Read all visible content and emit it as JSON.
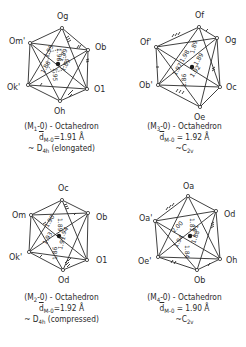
{
  "panels": [
    {
      "id": "M1",
      "title_prefix": "(M",
      "title_sub": "1",
      "title_suffix": "-0) - Octahedron",
      "d_prefix": "d",
      "d_sub": "M-0",
      "d_value": "=1.91 Å",
      "symmetry_prefix": "~ D",
      "symmetry_sub": "4h",
      "symmetry_suffix": " (elongated)",
      "vertices": [
        {
          "label": "Og",
          "sub": "g",
          "x": 62,
          "y": 28
        },
        {
          "label": "Om'",
          "sub": "m'",
          "x": 30,
          "y": 43
        },
        {
          "label": "Ob",
          "sub": "b",
          "x": 88,
          "y": 50
        },
        {
          "label": "Ok'",
          "sub": "k'",
          "x": 28,
          "y": 85
        },
        {
          "label": "O1",
          "sub": "1",
          "x": 87,
          "y": 89
        },
        {
          "label": "Oh",
          "sub": "h",
          "x": 60,
          "y": 101
        }
      ],
      "distances": [
        "1.98",
        "1.89",
        "1.89",
        "1.95",
        "1.95",
        "1.86"
      ]
    },
    {
      "id": "M3",
      "title_prefix": "(M",
      "title_sub": "3",
      "title_suffix": "-0) - Octahedron",
      "d_prefix": "d",
      "d_sub": "M-0",
      "d_value": " = 1.92 Å",
      "symmetry_prefix": "~C",
      "symmetry_sub": "2v",
      "symmetry_suffix": "",
      "vertices": [
        {
          "label": "Of",
          "sub": "f",
          "x": 199,
          "y": 27
        },
        {
          "label": "Of'",
          "sub": "f'",
          "x": 156,
          "y": 47
        },
        {
          "label": "Og",
          "sub": "g",
          "x": 217,
          "y": 38
        },
        {
          "label": "Ob'",
          "sub": "b'",
          "x": 158,
          "y": 85
        },
        {
          "label": "Oc",
          "sub": "c",
          "x": 220,
          "y": 87
        },
        {
          "label": "Oe",
          "sub": "e",
          "x": 200,
          "y": 107
        }
      ],
      "distances": [
        "1.89",
        "1.89",
        "1.98",
        "1.97",
        "1.92",
        "1.86"
      ]
    },
    {
      "id": "M2",
      "title_prefix": "(M",
      "title_sub": "2",
      "title_suffix": "-0) - Octahedron",
      "d_prefix": "d",
      "d_sub": "M-0",
      "d_value": "=1.92 Å",
      "symmetry_prefix": "~ D",
      "symmetry_sub": "4h",
      "symmetry_suffix": " (compressed)",
      "vertices": [
        {
          "label": "Oc",
          "sub": "c",
          "x": 62,
          "y": 200
        },
        {
          "label": "Om",
          "sub": "m",
          "x": 31,
          "y": 215
        },
        {
          "label": "Ob",
          "sub": "b",
          "x": 88,
          "y": 213
        },
        {
          "label": "Ok'",
          "sub": "k'",
          "x": 29,
          "y": 252
        },
        {
          "label": "O1",
          "sub": "1",
          "x": 87,
          "y": 260
        },
        {
          "label": "Od",
          "sub": "d",
          "x": 63,
          "y": 270
        }
      ],
      "distances": [
        "1.89",
        "1.94",
        "1.90",
        "1.93",
        "1.91",
        "1.86"
      ]
    },
    {
      "id": "M4",
      "title_prefix": "(M",
      "title_sub": "4",
      "title_suffix": "-0) - Octahedron",
      "d_prefix": "d",
      "d_sub": "M-0",
      "d_value": " = 1.90 Å",
      "symmetry_prefix": "~C",
      "symmetry_sub": "2v",
      "symmetry_suffix": "",
      "vertices": [
        {
          "label": "Oa",
          "sub": "a",
          "x": 188,
          "y": 196
        },
        {
          "label": "Oa'",
          "sub": "a'",
          "x": 155,
          "y": 221
        },
        {
          "label": "Od",
          "sub": "d",
          "x": 216,
          "y": 211
        },
        {
          "label": "Oe'",
          "sub": "e'",
          "x": 158,
          "y": 257
        },
        {
          "label": "Oh",
          "sub": "h",
          "x": 220,
          "y": 259
        },
        {
          "label": "Ob",
          "sub": "b",
          "x": 197,
          "y": 270
        }
      ],
      "distances": [
        "1.81",
        "1.91",
        "2.00",
        "1.88",
        "1.94",
        "1.84"
      ]
    }
  ],
  "colors": {
    "ink": "#2a2a2a",
    "background": "#ffffff"
  }
}
